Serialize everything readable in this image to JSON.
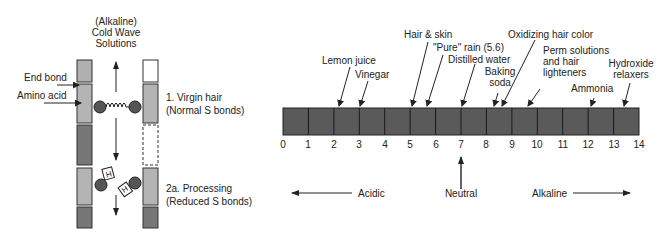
{
  "left_diagram": {
    "title_lines": [
      "(Alkaline)",
      "Cold Wave",
      "Solutions"
    ],
    "labels": {
      "end_bond": "End bond",
      "amino_acid": "Amino acid"
    },
    "stages": [
      {
        "line1": "1.  Virgin hair",
        "line2": "(Normal S bonds)"
      },
      {
        "line1": "2a.  Processing",
        "line2": "(Reduced S bonds)"
      }
    ],
    "hydrogen_symbol": "H"
  },
  "ph_scale": {
    "ticks": [
      "0",
      "1",
      "2",
      "3",
      "4",
      "5",
      "6",
      "7",
      "8",
      "9",
      "10",
      "11",
      "12",
      "13",
      "14"
    ],
    "bar_color": "#585858",
    "annotations": [
      {
        "label_lines": [
          "Lemon juice"
        ],
        "value": 2.2
      },
      {
        "label_lines": [
          "Vinegar"
        ],
        "value": 3.0
      },
      {
        "label_lines": [
          "Hair & skin"
        ],
        "value": 5.0
      },
      {
        "label_lines": [
          "\"Pure\" rain (5.6)"
        ],
        "value": 5.6
      },
      {
        "label_lines": [
          "Distilled water"
        ],
        "value": 7.0
      },
      {
        "label_lines": [
          "Baking",
          "soda"
        ],
        "value": 8.3
      },
      {
        "label_lines": [
          "Oxidizing hair color"
        ],
        "value": 8.7
      },
      {
        "label_lines": [
          "Perm solutions",
          "and hair",
          "lighteners"
        ],
        "value": 9.7
      },
      {
        "label_lines": [
          "Ammonia"
        ],
        "value": 12.1
      },
      {
        "label_lines": [
          "Hydroxide",
          "relaxers"
        ],
        "value": 13.4
      }
    ],
    "directions": {
      "acidic": "Acidic",
      "neutral": "Neutral",
      "alkaline": "Alkaline"
    }
  }
}
